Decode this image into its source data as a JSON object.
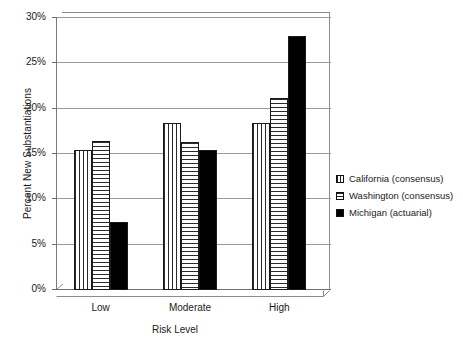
{
  "chart_data": {
    "type": "bar",
    "title": "",
    "xlabel": "Risk Level",
    "ylabel": "Percent New Substantiations",
    "categories": [
      "Low",
      "Moderate",
      "High"
    ],
    "series": [
      {
        "name": "California (consensus)",
        "values": [
          15.4,
          18.4,
          18.4
        ],
        "pattern": "vertical-lines"
      },
      {
        "name": "Washington (consensus)",
        "values": [
          16.4,
          16.3,
          21.2
        ],
        "pattern": "horizontal-lines"
      },
      {
        "name": "Michigan (actuarial)",
        "values": [
          7.5,
          15.4,
          28.0
        ],
        "pattern": "solid-black"
      }
    ],
    "ylim": [
      0,
      30
    ],
    "yticks": [
      0,
      5,
      10,
      15,
      20,
      25,
      30
    ],
    "ytick_labels": [
      "0%",
      "5%",
      "10%",
      "15%",
      "20%",
      "25%",
      "30%"
    ],
    "grid": true,
    "legend_position": "right"
  },
  "axes": {
    "y_title": "Percent New Substantiations",
    "x_title": "Risk Level"
  },
  "legend": {
    "items": [
      {
        "label": "California (consensus)"
      },
      {
        "label": "Washington (consensus)"
      },
      {
        "label": "Michigan (actuarial)"
      }
    ]
  },
  "colors": {
    "bar_outline": "#1a1a1a",
    "solid_series": "#000000",
    "gridline": "#9a9a9a",
    "axis": "#6f6f6f",
    "background": "#ffffff",
    "text": "#1a1a1a"
  }
}
